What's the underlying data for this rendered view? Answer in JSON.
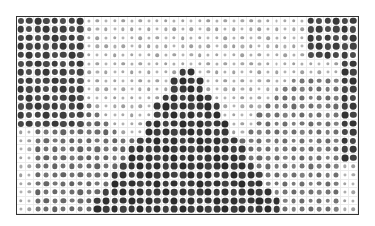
{
  "image": {
    "description": "Halftone dot-grid image: dark corners top-left and top-right, light inverted-V band, dark central pyramid triangle, mid-grey triangles lower-left and lower-right",
    "frame_color": "#333333",
    "grid_line_color": "#ececec",
    "columns": 40,
    "rows": 23,
    "dot_color": "#222222"
  }
}
